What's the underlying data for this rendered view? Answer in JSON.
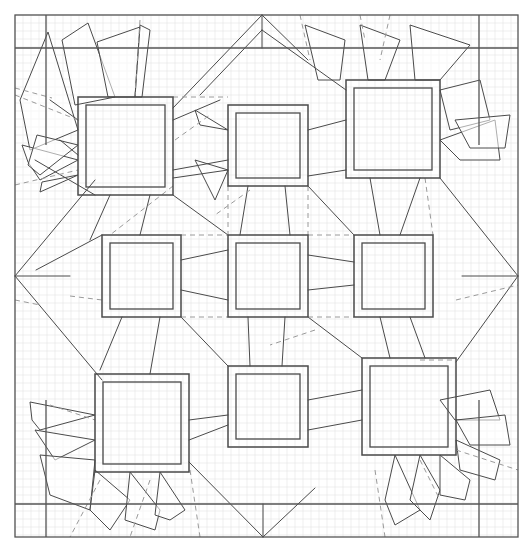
{
  "diagram": {
    "title": "",
    "width": 532,
    "height": 550,
    "colors": {
      "background": "#ffffff",
      "grid": "#e4e4e4",
      "line": "#4a4a4a",
      "dashed": "#9a9a9a"
    },
    "grid": {
      "x0": 15,
      "y0": 15,
      "x1": 518,
      "y1": 537,
      "step": 8
    },
    "outer_border": {
      "x": 15,
      "y": 15,
      "w": 503,
      "h": 522
    },
    "frame_lines": [
      [
        15,
        48,
        518,
        48
      ],
      [
        15,
        504,
        518,
        504
      ],
      [
        46,
        15,
        46,
        145
      ],
      [
        46,
        400,
        46,
        537
      ],
      [
        479,
        15,
        479,
        145
      ],
      [
        479,
        400,
        479,
        537
      ]
    ],
    "squares": [
      {
        "id": "top-left",
        "outer": [
          78,
          97,
          95,
          98
        ],
        "inner": [
          86,
          105,
          79,
          82
        ]
      },
      {
        "id": "top-center",
        "outer": [
          228,
          105,
          80,
          81
        ],
        "inner": [
          236,
          113,
          64,
          65
        ]
      },
      {
        "id": "top-right",
        "outer": [
          346,
          80,
          94,
          98
        ],
        "inner": [
          354,
          88,
          78,
          82
        ]
      },
      {
        "id": "middle-left",
        "outer": [
          102,
          235,
          79,
          82
        ],
        "inner": [
          110,
          243,
          63,
          66
        ]
      },
      {
        "id": "middle-center",
        "outer": [
          228,
          235,
          80,
          82
        ],
        "inner": [
          236,
          243,
          64,
          66
        ]
      },
      {
        "id": "middle-right",
        "outer": [
          354,
          235,
          79,
          82
        ],
        "inner": [
          362,
          243,
          63,
          66
        ]
      },
      {
        "id": "bottom-left",
        "outer": [
          95,
          374,
          94,
          98
        ],
        "inner": [
          103,
          382,
          78,
          82
        ]
      },
      {
        "id": "bottom-center",
        "outer": [
          228,
          366,
          80,
          81
        ],
        "inner": [
          236,
          374,
          64,
          65
        ]
      },
      {
        "id": "bottom-right",
        "outer": [
          362,
          358,
          94,
          97
        ],
        "inner": [
          370,
          366,
          78,
          81
        ]
      }
    ],
    "creases": [
      [
        15,
        276,
        70,
        276
      ],
      [
        462,
        276,
        518,
        276
      ],
      [
        262,
        15,
        173,
        108
      ],
      [
        262,
        15,
        308,
        60
      ],
      [
        262,
        15,
        262,
        48
      ],
      [
        263,
        537,
        189,
        462
      ],
      [
        263,
        537,
        315,
        488
      ],
      [
        263,
        537,
        263,
        504
      ],
      [
        15,
        276,
        95,
        180
      ],
      [
        15,
        276,
        102,
        380
      ],
      [
        518,
        276,
        440,
        178
      ],
      [
        518,
        276,
        456,
        362
      ],
      [
        35,
        160,
        95,
        195
      ],
      [
        36,
        270,
        102,
        235
      ],
      [
        262,
        30,
        200,
        95
      ],
      [
        262,
        30,
        346,
        90
      ],
      [
        50,
        100,
        78,
        120
      ],
      [
        60,
        140,
        78,
        155
      ],
      [
        173,
        120,
        220,
        100
      ],
      [
        173,
        170,
        228,
        160
      ],
      [
        173,
        178,
        228,
        170
      ],
      [
        308,
        130,
        346,
        120
      ],
      [
        308,
        176,
        346,
        170
      ],
      [
        181,
        260,
        228,
        250
      ],
      [
        181,
        290,
        228,
        300
      ],
      [
        308,
        255,
        354,
        262
      ],
      [
        308,
        290,
        354,
        285
      ],
      [
        189,
        420,
        228,
        415
      ],
      [
        189,
        440,
        228,
        425
      ],
      [
        308,
        400,
        362,
        390
      ],
      [
        308,
        430,
        362,
        420
      ],
      [
        110,
        195,
        90,
        240
      ],
      [
        150,
        195,
        140,
        235
      ],
      [
        122,
        317,
        100,
        370
      ],
      [
        160,
        317,
        150,
        374
      ],
      [
        248,
        186,
        240,
        235
      ],
      [
        285,
        186,
        290,
        235
      ],
      [
        248,
        317,
        250,
        366
      ],
      [
        285,
        317,
        282,
        366
      ],
      [
        370,
        178,
        380,
        235
      ],
      [
        420,
        178,
        400,
        235
      ],
      [
        380,
        317,
        390,
        358
      ],
      [
        410,
        317,
        425,
        358
      ],
      [
        173,
        195,
        228,
        235
      ],
      [
        308,
        186,
        354,
        235
      ],
      [
        181,
        317,
        228,
        366
      ],
      [
        308,
        317,
        362,
        358
      ]
    ],
    "flaps": [
      [
        [
          48,
          32
        ],
        [
          78,
          130
        ],
        [
          30,
          150
        ],
        [
          20,
          100
        ]
      ],
      [
        [
          88,
          23
        ],
        [
          115,
          97
        ],
        [
          75,
          105
        ],
        [
          62,
          40
        ]
      ],
      [
        [
          97,
          42
        ],
        [
          140,
          27
        ],
        [
          135,
          97
        ],
        [
          108,
          97
        ]
      ],
      [
        [
          140,
          25
        ],
        [
          150,
          30
        ],
        [
          142,
          97
        ],
        [
          135,
          97
        ]
      ],
      [
        [
          22,
          145
        ],
        [
          78,
          160
        ],
        [
          40,
          180
        ],
        [
          28,
          162
        ]
      ],
      [
        [
          37,
          135
        ],
        [
          78,
          145
        ],
        [
          40,
          175
        ],
        [
          28,
          165
        ]
      ],
      [
        [
          42,
          182
        ],
        [
          78,
          175
        ],
        [
          40,
          192
        ]
      ],
      [
        [
          195,
          110
        ],
        [
          228,
          130
        ],
        [
          200,
          125
        ]
      ],
      [
        [
          195,
          160
        ],
        [
          228,
          170
        ],
        [
          215,
          200
        ]
      ],
      [
        [
          305,
          25
        ],
        [
          345,
          40
        ],
        [
          340,
          80
        ],
        [
          318,
          80
        ]
      ],
      [
        [
          360,
          25
        ],
        [
          400,
          40
        ],
        [
          385,
          80
        ],
        [
          368,
          80
        ]
      ],
      [
        [
          410,
          25
        ],
        [
          470,
          45
        ],
        [
          440,
          80
        ],
        [
          415,
          80
        ]
      ],
      [
        [
          440,
          90
        ],
        [
          480,
          80
        ],
        [
          490,
          120
        ],
        [
          450,
          130
        ]
      ],
      [
        [
          440,
          140
        ],
        [
          495,
          120
        ],
        [
          500,
          160
        ],
        [
          460,
          160
        ]
      ],
      [
        [
          455,
          120
        ],
        [
          510,
          115
        ],
        [
          505,
          148
        ],
        [
          470,
          148
        ]
      ],
      [
        [
          30,
          402
        ],
        [
          95,
          415
        ],
        [
          40,
          430
        ],
        [
          32,
          420
        ]
      ],
      [
        [
          35,
          430
        ],
        [
          95,
          440
        ],
        [
          55,
          460
        ],
        [
          45,
          445
        ]
      ],
      [
        [
          40,
          455
        ],
        [
          95,
          460
        ],
        [
          90,
          510
        ],
        [
          50,
          495
        ]
      ],
      [
        [
          95,
          470
        ],
        [
          130,
          500
        ],
        [
          110,
          530
        ],
        [
          90,
          510
        ]
      ],
      [
        [
          130,
          472
        ],
        [
          160,
          510
        ],
        [
          155,
          530
        ],
        [
          125,
          520
        ]
      ],
      [
        [
          160,
          472
        ],
        [
          185,
          510
        ],
        [
          170,
          520
        ],
        [
          155,
          515
        ]
      ],
      [
        [
          440,
          400
        ],
        [
          490,
          390
        ],
        [
          500,
          420
        ],
        [
          455,
          420
        ]
      ],
      [
        [
          456,
          420
        ],
        [
          505,
          415
        ],
        [
          510,
          445
        ],
        [
          470,
          445
        ]
      ],
      [
        [
          456,
          440
        ],
        [
          500,
          460
        ],
        [
          495,
          480
        ],
        [
          460,
          470
        ]
      ],
      [
        [
          395,
          455
        ],
        [
          420,
          510
        ],
        [
          395,
          525
        ],
        [
          385,
          500
        ]
      ],
      [
        [
          420,
          455
        ],
        [
          440,
          490
        ],
        [
          430,
          520
        ],
        [
          410,
          500
        ]
      ],
      [
        [
          440,
          455
        ],
        [
          470,
          480
        ],
        [
          465,
          500
        ],
        [
          440,
          495
        ]
      ]
    ],
    "dashes": [
      [
        15,
        88,
        52,
        98
      ],
      [
        15,
        95,
        78,
        120
      ],
      [
        15,
        185,
        78,
        170
      ],
      [
        140,
        20,
        135,
        95
      ],
      [
        173,
        97,
        228,
        97
      ],
      [
        175,
        140,
        210,
        115
      ],
      [
        228,
        186,
        228,
        235
      ],
      [
        308,
        186,
        308,
        235
      ],
      [
        181,
        235,
        228,
        235
      ],
      [
        308,
        235,
        354,
        235
      ],
      [
        181,
        317,
        228,
        317
      ],
      [
        308,
        317,
        354,
        317
      ],
      [
        173,
        186,
        110,
        235
      ],
      [
        425,
        178,
        433,
        235
      ],
      [
        15,
        300,
        40,
        305
      ],
      [
        70,
        296,
        102,
        300
      ],
      [
        50,
        405,
        95,
        420
      ],
      [
        420,
        360,
        456,
        360
      ],
      [
        456,
        300,
        518,
        285
      ],
      [
        456,
        450,
        518,
        470
      ],
      [
        100,
        480,
        70,
        537
      ],
      [
        150,
        480,
        130,
        537
      ],
      [
        190,
        470,
        200,
        537
      ],
      [
        375,
        470,
        385,
        537
      ],
      [
        420,
        460,
        440,
        500
      ],
      [
        300,
        15,
        310,
        60
      ],
      [
        360,
        15,
        365,
        40
      ],
      [
        390,
        15,
        380,
        60
      ],
      [
        250,
        190,
        215,
        215
      ],
      [
        315,
        330,
        270,
        345
      ]
    ]
  }
}
